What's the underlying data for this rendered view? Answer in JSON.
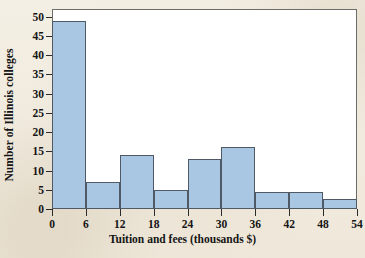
{
  "chart_data": {
    "type": "bar",
    "title": "",
    "xlabel": "Tuition and fees (thousands $)",
    "ylabel": "Number of Illinois colleges",
    "bin_width": 6,
    "bin_edges": [
      0,
      6,
      12,
      18,
      24,
      30,
      36,
      42,
      48,
      54
    ],
    "categories": [
      "0-6",
      "6-12",
      "12-18",
      "18-24",
      "24-30",
      "30-36",
      "36-42",
      "42-48",
      "48-54"
    ],
    "values": [
      49,
      7,
      14,
      5,
      13,
      16,
      4.5,
      4.5,
      2.5
    ],
    "xlim": [
      0,
      54
    ],
    "ylim": [
      0,
      52
    ],
    "xticks": [
      "0",
      "6",
      "12",
      "18",
      "24",
      "30",
      "36",
      "42",
      "48",
      "54"
    ],
    "xtick_values": [
      0,
      6,
      12,
      18,
      24,
      30,
      36,
      42,
      48,
      54
    ],
    "yticks": [
      "0",
      "5",
      "10",
      "15",
      "20",
      "25",
      "30",
      "35",
      "40",
      "45",
      "50"
    ],
    "ytick_values": [
      0,
      5,
      10,
      15,
      20,
      25,
      30,
      35,
      40,
      45,
      50
    ],
    "grid": false,
    "legend": null,
    "bar_color": "#a9c6e3",
    "bar_edge_color": "#4f5a66",
    "plot_background": "#ffffff",
    "figure_background": "#f2ece0",
    "axis_color": "#2b2b2b",
    "frame_color": "#6d6d68"
  }
}
